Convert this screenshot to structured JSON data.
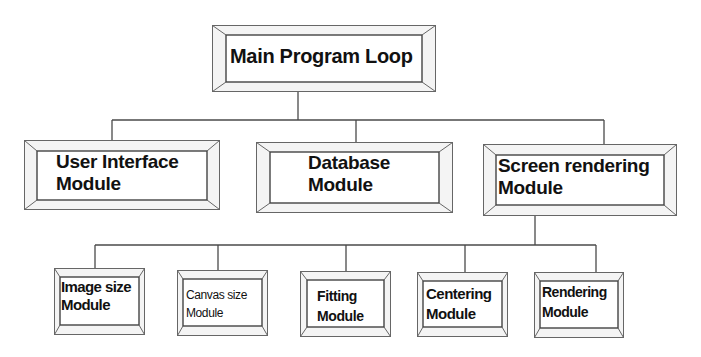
{
  "diagram": {
    "type": "hierarchy",
    "root": {
      "id": "main",
      "label": "Main Program Loop"
    },
    "level1": [
      {
        "id": "ui",
        "line1": "User Interface",
        "line2": "Module"
      },
      {
        "id": "db",
        "line1": "Database",
        "line2": "Module"
      },
      {
        "id": "screen",
        "line1": "Screen rendering",
        "line2": "Module"
      }
    ],
    "level2_parent": "screen",
    "level2": [
      {
        "id": "image_size",
        "line1": "Image size",
        "line2": "Module"
      },
      {
        "id": "canvas_size",
        "line1": "Canvas size",
        "line2": "Module"
      },
      {
        "id": "fitting",
        "line1": "Fitting",
        "line2": "Module"
      },
      {
        "id": "centering",
        "line1": "Centering",
        "line2": "Module"
      },
      {
        "id": "rendering",
        "line1": "Rendering",
        "line2": "Module"
      }
    ],
    "colors": {
      "line": "#4a4a4a",
      "box_border": "#555555",
      "box_fill": "#ffffff",
      "text": "#111111"
    }
  }
}
